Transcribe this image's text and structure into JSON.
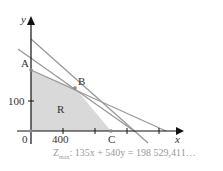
{
  "axes": {
    "x_label": "x",
    "y_label": "y",
    "origin": "0",
    "x_tick": "400",
    "y_tick": "100"
  },
  "points": {
    "A": "A",
    "B": "B",
    "C": "C"
  },
  "region": "R",
  "objective": {
    "z": "Z",
    "sub": "max",
    "text": ": 135x + 540y = 198 529,411…"
  },
  "colors": {
    "region": "#d8d8d8",
    "lines": "#999999",
    "axes": "#111111"
  }
}
